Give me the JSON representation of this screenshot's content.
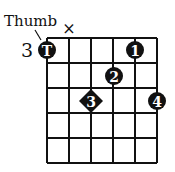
{
  "diagram": {
    "type": "chord-fingering-chart",
    "strings": 6,
    "frets": 5,
    "start_fret_label": "3",
    "thumb_label": "Thumb",
    "muted_marker": "×",
    "muted_string": 2,
    "markers": [
      {
        "label": "T",
        "string": 1,
        "fret": 1,
        "shape": "circle"
      },
      {
        "label": "1",
        "string": 5,
        "fret": 1,
        "shape": "circle"
      },
      {
        "label": "2",
        "string": 4,
        "fret": 2,
        "shape": "circle"
      },
      {
        "label": "3",
        "string": 3,
        "fret": 3,
        "shape": "diamond"
      },
      {
        "label": "4",
        "string": 6,
        "fret": 3,
        "shape": "circle"
      }
    ]
  }
}
